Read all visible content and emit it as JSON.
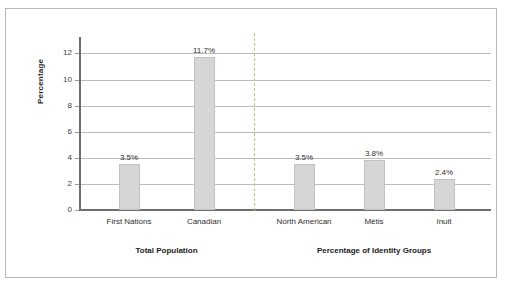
{
  "chart_data": {
    "type": "bar",
    "title": "",
    "subtitle": "",
    "xlabel": "",
    "ylabel": "Percentage",
    "ylim": [
      0,
      12.8
    ],
    "yticks": [
      0,
      2,
      4,
      6,
      8,
      10,
      12
    ],
    "ytick_labels": [
      "0",
      "2",
      "4",
      "6",
      "8",
      "10",
      "12"
    ],
    "grid": "horizontal",
    "legend": "none",
    "categories": [
      "First Nations",
      "Canadian",
      "North American",
      "Métis",
      "Inuit"
    ],
    "values": [
      3.5,
      11.7,
      3.5,
      3.8,
      2.4
    ],
    "data_labels": [
      "3.5%",
      "11.7%",
      "3.5%",
      "3.8%",
      "2.4%"
    ],
    "bar_color": "#d6d6d6",
    "bar_border_color": "#c2c2c2",
    "gridline_color": "#bcbcbc",
    "axis_color": "#6f6f6f",
    "divider_color": "#c9b98f",
    "groups": [
      {
        "label": "Total Population",
        "categories": [
          "First Nations",
          "Canadian"
        ]
      },
      {
        "label": "Percentage of Identity Groups",
        "categories": [
          "North American",
          "Métis",
          "Inuit"
        ]
      }
    ]
  }
}
